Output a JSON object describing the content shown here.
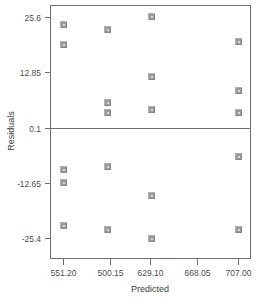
{
  "chart_data": {
    "type": "scatter",
    "title": "",
    "xlabel": "Predicted",
    "ylabel": "Residuals",
    "grid": false,
    "legend": false,
    "xlim": [
      531.725,
      726.475
    ],
    "ylim": [
      -31.775,
      31.975
    ],
    "xticks": [
      551.2,
      500.15,
      629.1,
      668.05,
      707.0
    ],
    "xtick_labels": [
      "551.20",
      "500.15",
      "629.10",
      "668.05",
      "707.00"
    ],
    "yticks": [
      25.6,
      12.85,
      0.1,
      -12.65,
      -25.4
    ],
    "ytick_labels": [
      "25.6",
      "12.85",
      "0.1",
      "-12.65",
      "-25.4"
    ],
    "reference_line": {
      "axis": "y",
      "value": 0.1
    },
    "marker": {
      "shape": "square",
      "edge_color": "#9a9a9a",
      "face_color": "#d8d8d8",
      "size": 6
    },
    "points": [
      {
        "x": 551.2,
        "y": 24.1
      },
      {
        "x": 551.2,
        "y": 19.3
      },
      {
        "x": 551.2,
        "y": -9.4
      },
      {
        "x": 551.2,
        "y": -12.4
      },
      {
        "x": 551.2,
        "y": -22.3
      },
      {
        "x": 590.15,
        "y": 22.8
      },
      {
        "x": 590.15,
        "y": 6.1
      },
      {
        "x": 590.15,
        "y": 3.6
      },
      {
        "x": 590.15,
        "y": -8.8
      },
      {
        "x": 590.15,
        "y": -23.4
      },
      {
        "x": 629.1,
        "y": 25.8
      },
      {
        "x": 629.1,
        "y": 12.0
      },
      {
        "x": 629.1,
        "y": 4.4
      },
      {
        "x": 629.1,
        "y": -15.5
      },
      {
        "x": 629.1,
        "y": -25.4
      },
      {
        "x": 707.0,
        "y": 20.0
      },
      {
        "x": 707.0,
        "y": 8.7
      },
      {
        "x": 707.0,
        "y": 3.6
      },
      {
        "x": 707.0,
        "y": -6.5
      },
      {
        "x": 707.0,
        "y": -23.4
      }
    ]
  },
  "layout": {
    "plot_left": 50,
    "plot_right": 250,
    "plot_top": 5,
    "plot_bottom": 258,
    "tick_x_positions": [
      63,
      110,
      150,
      197,
      238
    ],
    "tick_y_positions": [
      17,
      72,
      128,
      183,
      238
    ]
  }
}
